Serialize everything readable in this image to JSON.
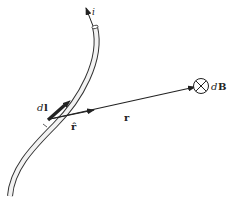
{
  "diagram": {
    "labels": {
      "current": "i",
      "element": "d l",
      "element_display": "dl",
      "unit_vector": "r̂",
      "displacement": "r",
      "field": "d B",
      "field_d": "d",
      "field_B": "B"
    },
    "elements": [
      {
        "name": "wire",
        "description": "curved tube-shaped conductor"
      },
      {
        "name": "current-arrow",
        "description": "arrow at top of wire indicating current direction i"
      },
      {
        "name": "dl-segment",
        "description": "highlighted short segment of wire labeled dl with arrow"
      },
      {
        "name": "unit-vector-r-hat",
        "description": "short arrow from dl toward point, labeled r-hat"
      },
      {
        "name": "vector-r",
        "description": "long arrow from dl to field point, labeled r"
      },
      {
        "name": "field-point",
        "description": "circle with X indicating dB into page"
      }
    ],
    "colors": {
      "stroke": "#222222",
      "wire_fill": "#f2f2f2"
    }
  }
}
